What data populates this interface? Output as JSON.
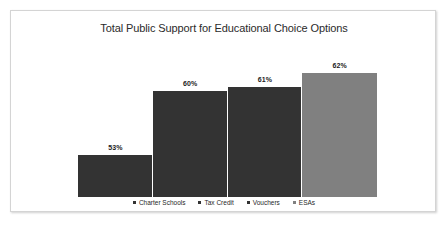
{
  "chart_data": {
    "type": "bar",
    "title": "Total Public Support for Educational Choice Options",
    "xlabel": "",
    "ylabel": "",
    "categories": [
      "Charter Schools",
      "Tax Credit",
      "Vouchers",
      "ESAs"
    ],
    "values": [
      53,
      60,
      61,
      62
    ],
    "value_labels": [
      "53%",
      "60%",
      "61%",
      "62%"
    ],
    "series": [
      {
        "name": "Total Public Support",
        "values": [
          53,
          60,
          61,
          62
        ]
      }
    ],
    "colors": [
      "#333333",
      "#333333",
      "#333333",
      "#808080"
    ],
    "grid": false,
    "axis_visible": false,
    "legend_position": "bottom",
    "bar_gap": 0,
    "bar_tops_px": [
      144,
      80,
      76,
      62
    ],
    "baseline_px": 186
  },
  "frame": {
    "border_color": "#d4d4d4",
    "background": "#ffffff"
  },
  "legend": {
    "items": [
      {
        "label": "Charter Schools",
        "color": "#333333"
      },
      {
        "label": "Tax Credit",
        "color": "#333333"
      },
      {
        "label": "Vouchers",
        "color": "#333333"
      },
      {
        "label": "ESAs",
        "color": "#808080"
      }
    ]
  }
}
